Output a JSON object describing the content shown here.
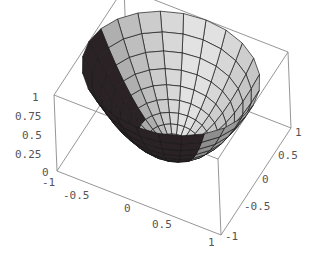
{
  "chart_data": {
    "type": "surface3d",
    "title": "",
    "function": "z = x^2 + y^2 (paraboloid bowl over unit disk)",
    "x_range": [
      -1,
      1
    ],
    "y_range": [
      -1,
      1
    ],
    "z_range": [
      0,
      1
    ],
    "x_ticks": [
      "-1",
      "-0.5",
      "0",
      "0.5",
      "1"
    ],
    "y_ticks": [
      "-1",
      "-0.5",
      "0",
      "0.5",
      "1"
    ],
    "z_ticks": [
      "0",
      "0.25",
      "0.5",
      "0.75",
      "1"
    ],
    "mesh": {
      "radial_divisions": 24,
      "height_divisions": 10
    },
    "colors": {
      "surface_light": "#d8d8d8",
      "surface_dark": "#2a2224",
      "mesh": "#1a1a1a",
      "box": "#8a8a8a"
    },
    "boxed": true
  }
}
